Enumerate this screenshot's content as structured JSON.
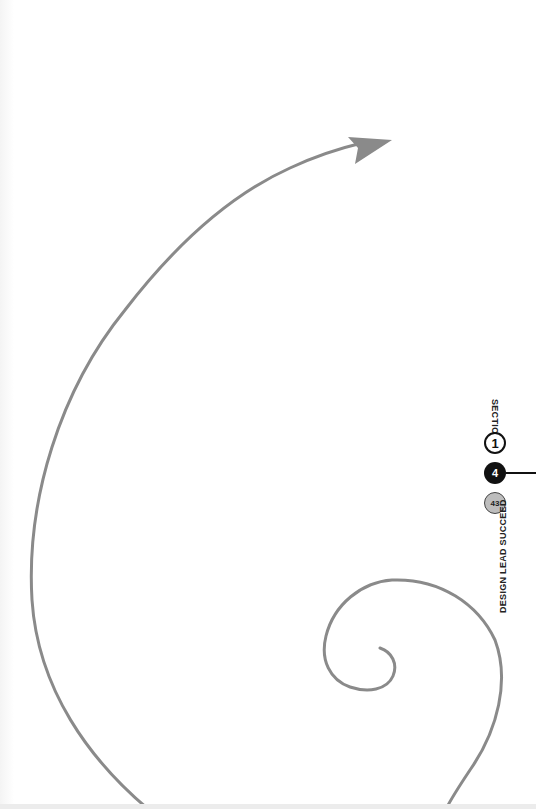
{
  "page": {
    "section_label": "SECTION",
    "section_number": "1",
    "chapter_number": "4",
    "page_number": "43",
    "book_title": "DESIGN LEAD SUCCEED"
  },
  "illustration": {
    "description": "spiral-arrow",
    "stroke_color": "#8a8a8a",
    "arrowhead_color": "#8a8a8a"
  },
  "colors": {
    "background": "#ffffff",
    "text": "#222222",
    "chapter_badge": "#111111",
    "page_badge": "#bdbdbd"
  }
}
